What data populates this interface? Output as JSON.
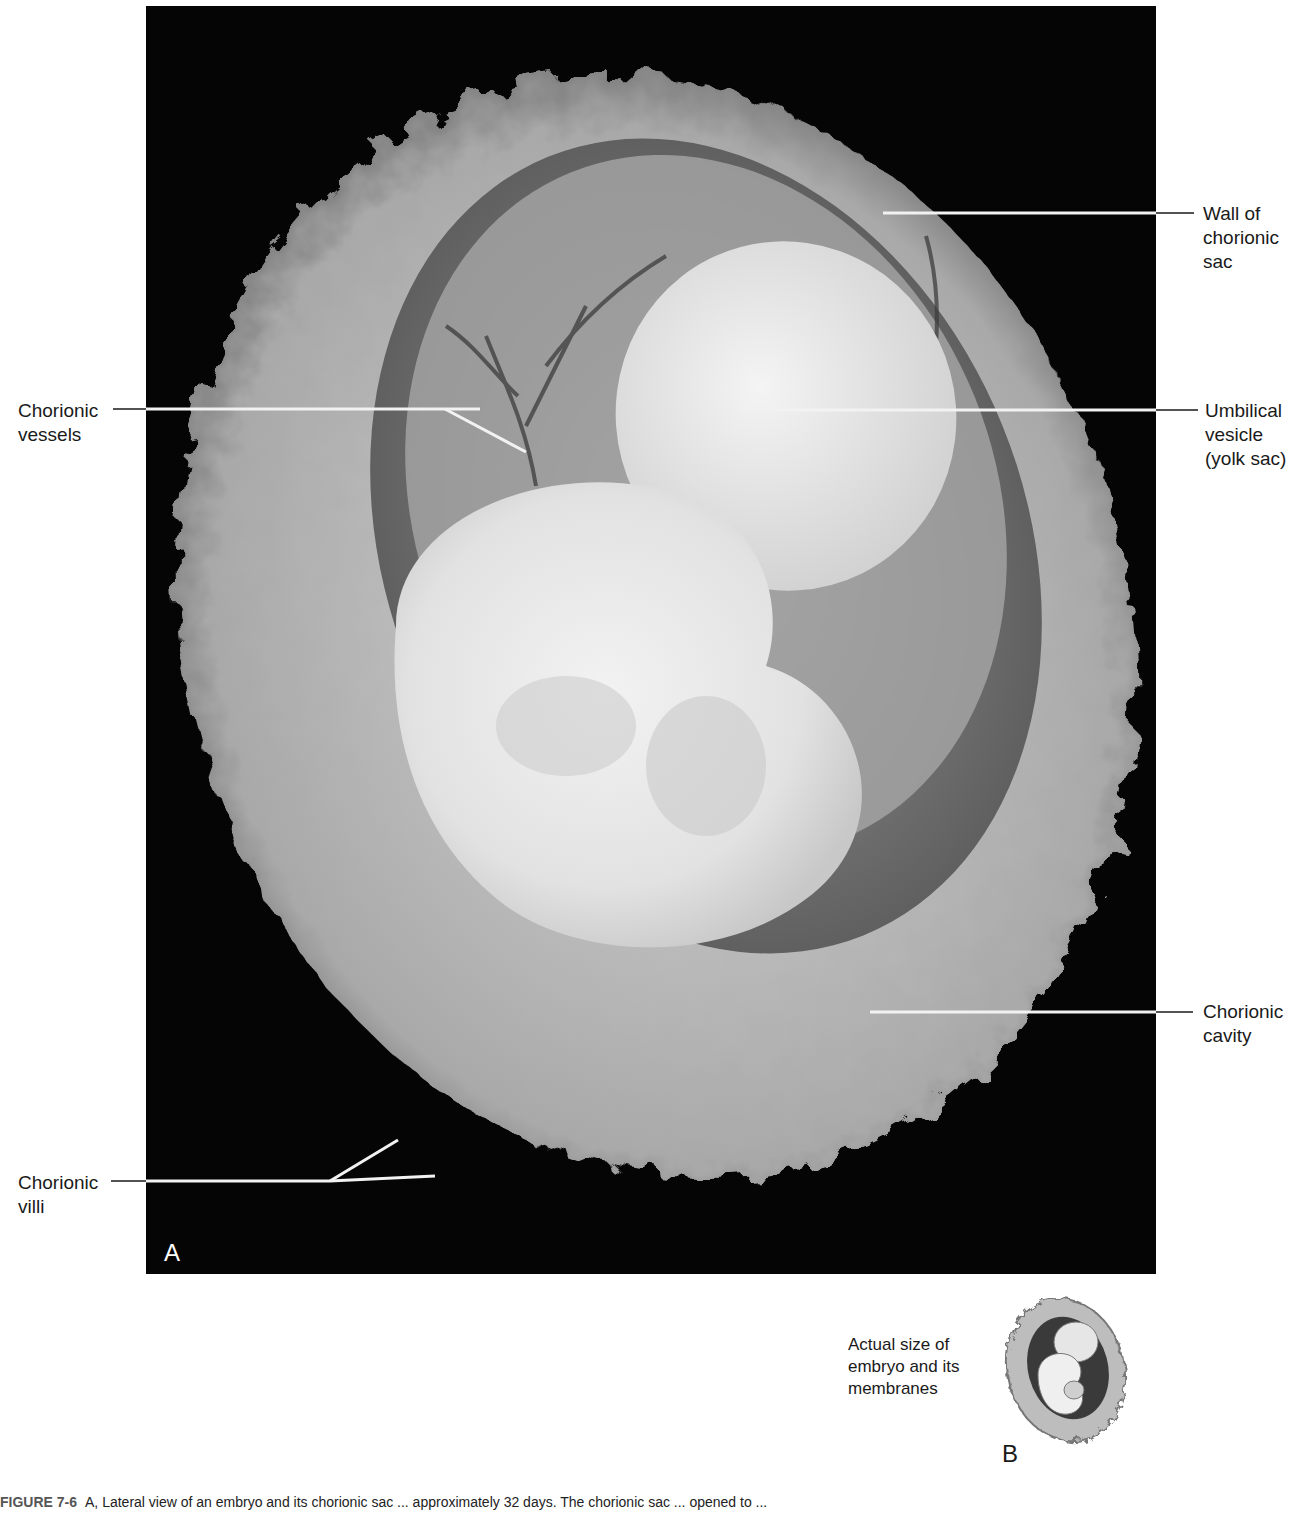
{
  "figure": {
    "panel_a_letter": "A",
    "panel_b_letter": "B",
    "caption_label": "FIGURE 7-6",
    "caption_text": "A, Lateral view of an embryo and its chorionic sac ... approximately 32 days. The chorionic sac ... opened to ..."
  },
  "labels": {
    "wall_of_chorionic_sac": "Wall of\nchorionic\nsac",
    "chorionic_vessels": "Chorionic\nvessels",
    "umbilical_vesicle": "Umbilical\nvesicle\n(yolk sac)",
    "chorionic_cavity": "Chorionic\ncavity",
    "chorionic_villi": "Chorionic\nvilli"
  },
  "inset": {
    "text": "Actual size of\nembryo and its\nmembranes"
  },
  "colors": {
    "photo_background": "#050505",
    "leader_line_on_photo": "#f2f2f2",
    "leader_line_on_page": "#1a1a1a"
  }
}
